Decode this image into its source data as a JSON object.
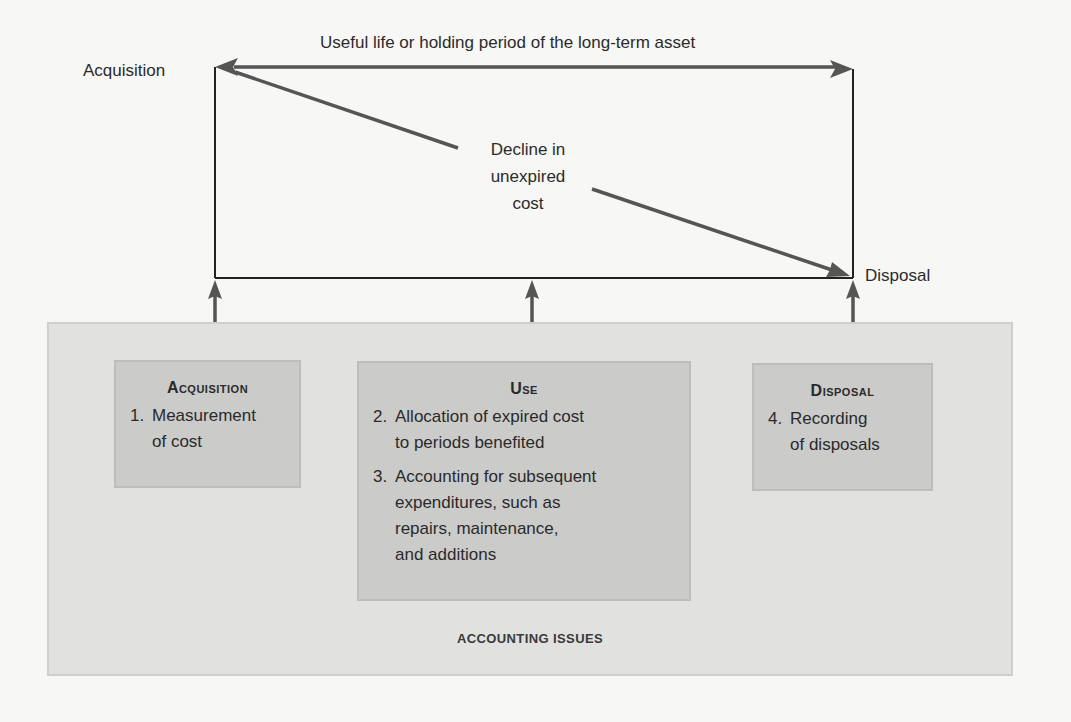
{
  "timeline": {
    "top_label": "Useful life or holding period of the long-term asset",
    "start_label": "Acquisition",
    "end_label": "Disposal",
    "decline_label_lines": [
      "Decline in",
      "unexpired",
      "cost"
    ]
  },
  "stages": [
    {
      "title": "Acquisition",
      "items": [
        {
          "number": "1.",
          "lines": [
            "Measurement",
            "of cost"
          ]
        }
      ]
    },
    {
      "title": "Use",
      "items": [
        {
          "number": "2.",
          "lines": [
            "Allocation of expired cost",
            "to periods benefited"
          ]
        },
        {
          "number": "3.",
          "lines": [
            "Accounting for subsequent",
            "expenditures, such as",
            "repairs, maintenance,",
            "and additions"
          ]
        }
      ]
    },
    {
      "title": "Disposal",
      "items": [
        {
          "number": "4.",
          "lines": [
            "Recording",
            "of disposals"
          ]
        }
      ]
    }
  ],
  "panel": {
    "label": "ACCOUNTING ISSUES"
  },
  "colors": {
    "background": "#f7f7f6",
    "panel_fill": "#e1e1e0",
    "box_fill": "#cbcbca",
    "arrow": "#555555",
    "frame": "#222222"
  }
}
